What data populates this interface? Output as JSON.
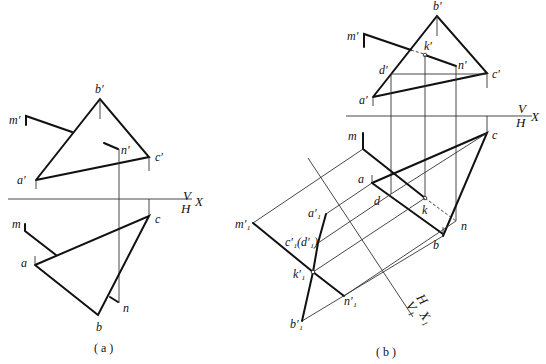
{
  "figure_a": {
    "caption": "( a )",
    "axis": {
      "upper": "V",
      "lower": "H",
      "right": "X"
    },
    "labels": {
      "b_prime": "b′",
      "m_prime": "m′",
      "n_prime": "n′",
      "c_prime": "c′",
      "a_prime": "a′",
      "m": "m",
      "c": "c",
      "a": "a",
      "n": "n",
      "b": "b"
    }
  },
  "figure_b": {
    "caption": "( b )",
    "axis": {
      "upper": "V",
      "lower": "H",
      "right": "X"
    },
    "axis1": {
      "H": "H",
      "V1": "V₁",
      "X1": "X₁"
    },
    "labels": {
      "b_prime": "b′",
      "m_prime": "m′",
      "k_prime": "k′",
      "d_prime": "d′",
      "n_prime": "n′",
      "c_prime": "c′",
      "a_prime": "a′",
      "m": "m",
      "c": "c",
      "a": "a",
      "d": "d",
      "k": "k",
      "n": "n",
      "b": "b",
      "m1_prime": "m′₁",
      "a1_prime": "a′₁",
      "c1d1_prime": "c′₁(d′₁)",
      "k1_prime": "k′₁",
      "n1_prime": "n′₁",
      "b1_prime": "b′₁"
    }
  }
}
